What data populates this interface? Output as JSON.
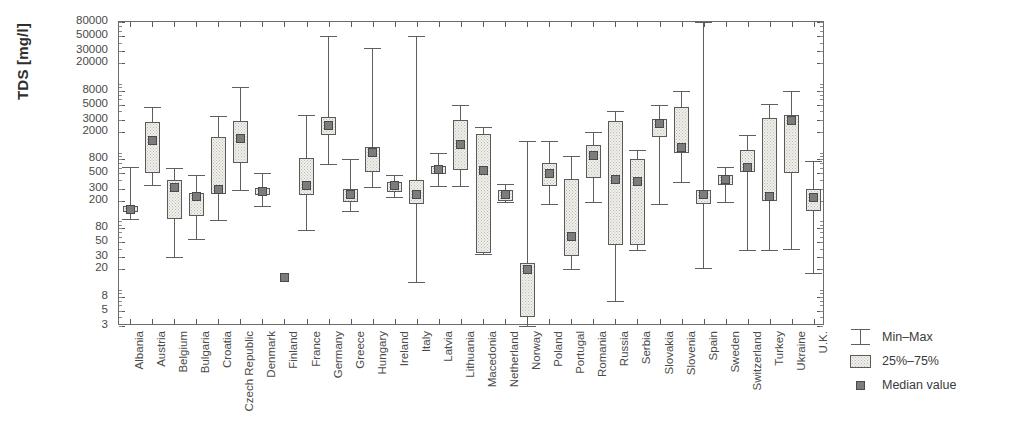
{
  "chart_data": {
    "type": "box",
    "title": "",
    "xlabel": "",
    "ylabel": "TDS [mg/l]",
    "yscale": "log",
    "ylim": [
      3,
      80000
    ],
    "ytick_labels": [
      "80000",
      "50000",
      "30000",
      "20000",
      "8000",
      "5000",
      "3000",
      "2000",
      "800",
      "500",
      "300",
      "200",
      "80",
      "50",
      "30",
      "20",
      "8",
      "5",
      "3"
    ],
    "ytick_values": [
      80000,
      50000,
      30000,
      20000,
      8000,
      5000,
      3000,
      2000,
      800,
      500,
      300,
      200,
      80,
      50,
      30,
      20,
      8,
      5,
      3
    ],
    "grid": false,
    "legend_position": "right",
    "categories": [
      "Albania",
      "Austria",
      "Belgium",
      "Bulgaria",
      "Croatia",
      "Czech Republic",
      "Denmark",
      "Finland",
      "France",
      "Germany",
      "Greece",
      "Hungary",
      "Ireland",
      "Italy",
      "Latvia",
      "Lithuania",
      "Macedonia",
      "Netherland",
      "Norway",
      "Poland",
      "Portugal",
      "Romania",
      "Russia",
      "Serbia",
      "Slovakia",
      "Slovenia",
      "Spain",
      "Sweden",
      "Switzerland",
      "Turkey",
      "Ukraine",
      "U.K."
    ],
    "series_names": [
      "Min-Max",
      "25%-75%",
      "Median value"
    ],
    "boxes": [
      {
        "category": "Albania",
        "min": 110,
        "q1": 135,
        "median": 150,
        "q3": 165,
        "max": 620
      },
      {
        "category": "Austria",
        "min": 340,
        "q1": 500,
        "median": 1500,
        "q3": 2800,
        "max": 4600
      },
      {
        "category": "Belgium",
        "min": 30,
        "q1": 110,
        "median": 310,
        "q3": 400,
        "max": 590
      },
      {
        "category": "Bulgaria",
        "min": 55,
        "q1": 120,
        "median": 230,
        "q3": 260,
        "max": 470
      },
      {
        "category": "Croatia",
        "min": 105,
        "q1": 250,
        "median": 290,
        "q3": 1700,
        "max": 3400
      },
      {
        "category": "Czech Republic",
        "min": 290,
        "q1": 720,
        "median": 1600,
        "q3": 2900,
        "max": 9000
      },
      {
        "category": "Denmark",
        "min": 165,
        "q1": 240,
        "median": 270,
        "q3": 310,
        "max": 500
      },
      {
        "category": "Finland",
        "min": null,
        "q1": null,
        "median": 15,
        "q3": null,
        "max": null
      },
      {
        "category": "France",
        "min": 75,
        "q1": 240,
        "median": 330,
        "q3": 840,
        "max": 3500
      },
      {
        "category": "Germany",
        "min": 680,
        "q1": 1800,
        "median": 2500,
        "q3": 3300,
        "max": 50000
      },
      {
        "category": "Greece",
        "min": 140,
        "q1": 190,
        "median": 250,
        "q3": 300,
        "max": 800
      },
      {
        "category": "Hungary",
        "min": 320,
        "q1": 520,
        "median": 1000,
        "q3": 1200,
        "max": 33000
      },
      {
        "category": "Ireland",
        "min": 230,
        "q1": 270,
        "median": 330,
        "q3": 380,
        "max": 470
      },
      {
        "category": "Italy",
        "min": 13,
        "q1": 180,
        "median": 250,
        "q3": 400,
        "max": 50000
      },
      {
        "category": "Latvia",
        "min": 330,
        "q1": 490,
        "median": 570,
        "q3": 640,
        "max": 1000
      },
      {
        "category": "Lithuania",
        "min": 330,
        "q1": 560,
        "median": 1300,
        "q3": 3000,
        "max": 5000
      },
      {
        "category": "Macedonia",
        "min": 33,
        "q1": 35,
        "median": 560,
        "q3": 1900,
        "max": 2400
      },
      {
        "category": "Netherland",
        "min": 190,
        "q1": 200,
        "median": 250,
        "q3": 290,
        "max": 350
      },
      {
        "category": "Norway",
        "min": 3,
        "q1": 4,
        "median": 20,
        "q3": 25,
        "max": 1500
      },
      {
        "category": "Poland",
        "min": 180,
        "q1": 330,
        "median": 490,
        "q3": 720,
        "max": 1500
      },
      {
        "category": "Portugal",
        "min": 20,
        "q1": 31,
        "median": 60,
        "q3": 420,
        "max": 900
      },
      {
        "category": "Romania",
        "min": 190,
        "q1": 430,
        "median": 900,
        "q3": 1300,
        "max": 2000
      },
      {
        "category": "Russia",
        "min": 7,
        "q1": 45,
        "median": 410,
        "q3": 2900,
        "max": 4000
      },
      {
        "category": "Serbia",
        "min": 38,
        "q1": 45,
        "median": 380,
        "q3": 800,
        "max": 1100
      },
      {
        "category": "Slovakia",
        "min": 180,
        "q1": 1700,
        "median": 2700,
        "q3": 3100,
        "max": 5000
      },
      {
        "category": "Slovenia",
        "min": 380,
        "q1": 1000,
        "median": 1200,
        "q3": 4700,
        "max": 8000
      },
      {
        "category": "Spain",
        "min": 21,
        "q1": 180,
        "median": 250,
        "q3": 290,
        "max": 80000
      },
      {
        "category": "Sweden",
        "min": 190,
        "q1": 340,
        "median": 410,
        "q3": 480,
        "max": 620
      },
      {
        "category": "Switzerland",
        "min": 38,
        "q1": 520,
        "median": 600,
        "q3": 1100,
        "max": 1800
      },
      {
        "category": "Turkey",
        "min": 38,
        "q1": 200,
        "median": 230,
        "q3": 3200,
        "max": 5200
      },
      {
        "category": "Ukraine",
        "min": 40,
        "q1": 500,
        "median": 2900,
        "q3": 3500,
        "max": 8000
      },
      {
        "category": "U.K.",
        "min": 18,
        "q1": 140,
        "median": 220,
        "q3": 300,
        "max": 750
      }
    ]
  },
  "legend": {
    "items": [
      {
        "key": "min-max",
        "label": "Min–Max"
      },
      {
        "key": "quartiles",
        "label": "25%–75%"
      },
      {
        "key": "median-value",
        "label": "Median value"
      }
    ]
  },
  "colors": {
    "box_fill": "#f2f0ec",
    "box_stroke": "#5a5a5a",
    "median_fill": "#7c7c7c",
    "whisker": "#5f5f5f",
    "axis": "#6b6b6b",
    "text": "#3a3a3a"
  }
}
